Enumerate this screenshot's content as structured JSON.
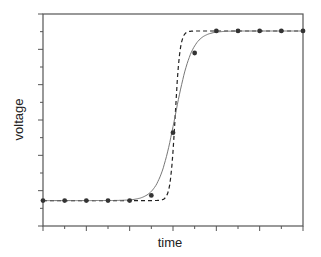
{
  "chart_data": {
    "type": "line",
    "title": "",
    "xlabel": "time",
    "ylabel": "voltage",
    "grid": false,
    "legend": null,
    "x_ticks": 12,
    "y_ticks": 12,
    "xlim": [
      0,
      12
    ],
    "ylim": [
      -0.15,
      1.1
    ],
    "series": [
      {
        "name": "measured",
        "style": "markers",
        "x": [
          0,
          1,
          2,
          3,
          4,
          5,
          6,
          7,
          8,
          9,
          10,
          11,
          12
        ],
        "y": [
          0,
          0,
          0,
          0,
          0,
          0.03,
          0.4,
          0.87,
          1.0,
          1.0,
          1.0,
          1.0,
          1.0
        ]
      },
      {
        "name": "fit",
        "style": "solid-line",
        "shape": "smooth sigmoid",
        "center": 6.1
      },
      {
        "name": "ideal",
        "style": "dashed-line",
        "shape": "sharp step",
        "center": 6.1
      }
    ]
  },
  "labels": {
    "x": "time",
    "y": "voltage"
  },
  "colors": {
    "axis": "#555555",
    "markers": "#333333",
    "fit": "#777777",
    "ideal": "#222222"
  }
}
